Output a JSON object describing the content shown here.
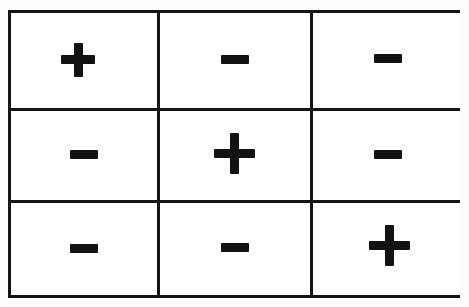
{
  "figure": {
    "kind": "sign-matrix-grid",
    "rows": 3,
    "columns": 3,
    "background_color": "#ffffff",
    "border_color": "#141414",
    "glyph_color": "#121212",
    "border_width_px": 3
  },
  "glyph_labels": {
    "plus": "+",
    "minus": "−"
  },
  "grid": {
    "cells": [
      [
        {
          "sign": "plus",
          "symbol": "+",
          "row": 1,
          "column": 1
        },
        {
          "sign": "minus",
          "symbol": "−",
          "row": 1,
          "column": 2
        },
        {
          "sign": "minus",
          "symbol": "−",
          "row": 1,
          "column": 3
        }
      ],
      [
        {
          "sign": "minus",
          "symbol": "−",
          "row": 2,
          "column": 1
        },
        {
          "sign": "plus",
          "symbol": "+",
          "row": 2,
          "column": 2
        },
        {
          "sign": "minus",
          "symbol": "−",
          "row": 2,
          "column": 3
        }
      ],
      [
        {
          "sign": "minus",
          "symbol": "−",
          "row": 3,
          "column": 1
        },
        {
          "sign": "minus",
          "symbol": "−",
          "row": 3,
          "column": 2
        },
        {
          "sign": "plus",
          "symbol": "+",
          "row": 3,
          "column": 3
        }
      ]
    ]
  }
}
